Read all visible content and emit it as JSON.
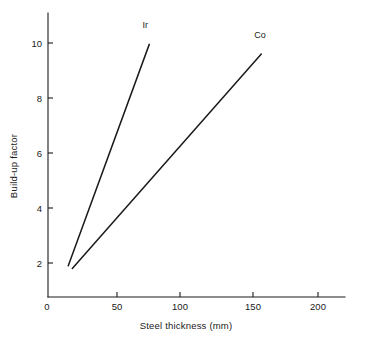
{
  "chart_data": {
    "type": "line",
    "title": "",
    "xlabel": "Steel thickness (mm)",
    "ylabel": "Build-up factor",
    "xlim": [
      0,
      215
    ],
    "ylim": [
      0,
      11.2
    ],
    "grid": false,
    "legend_position": "inline-end-of-line",
    "xticks": [
      0,
      50,
      100,
      150,
      200
    ],
    "xticklabels": [
      "0",
      "50",
      "100",
      "150",
      "200"
    ],
    "yticks": [
      2,
      4,
      6,
      8,
      10
    ],
    "yticklabels": [
      "2",
      "4",
      "6",
      "8",
      "10"
    ],
    "series": [
      {
        "name": "Ir",
        "label": "Ir",
        "x": [
          15,
          75
        ],
        "y": [
          1.9,
          9.95
        ],
        "color": "#1a1a1a"
      },
      {
        "name": "Co",
        "label": "Co",
        "x": [
          18,
          158
        ],
        "y": [
          1.8,
          9.6
        ],
        "color": "#1a1a1a"
      }
    ],
    "annotations": [
      {
        "text": "Ir",
        "x": 72,
        "y": 10.55
      },
      {
        "text": "Co",
        "x": 157,
        "y": 10.2
      }
    ]
  },
  "figure": {
    "background_color": "#ffffff",
    "axis_color": "#1a1a1a"
  }
}
